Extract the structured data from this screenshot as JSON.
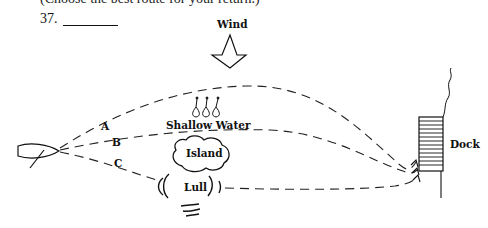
{
  "header": {
    "instruction": "(Choose the best route for your return.)",
    "question_number": "37."
  },
  "diagram": {
    "wind_label": "Wind",
    "shallow_water_label": "Shallow Water",
    "island_label": "Island",
    "lull_label": "Lull",
    "dock_label": "Dock",
    "routes": [
      {
        "id": "A",
        "label": "A",
        "description": "long route over shallow water, upwind of island"
      },
      {
        "id": "B",
        "label": "B",
        "description": "route between shallow water and island"
      },
      {
        "id": "C",
        "label": "C",
        "description": "route through lull below island"
      }
    ]
  }
}
